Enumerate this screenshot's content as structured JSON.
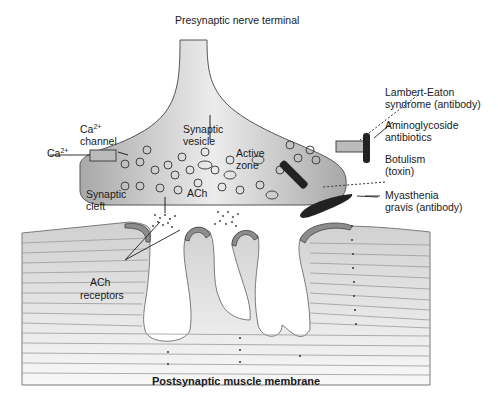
{
  "title": "Presynaptic nerve terminal",
  "footer": "Postsynaptic muscle membrane",
  "labels": {
    "ca_channel_a": "Ca",
    "ca_channel_sup": "2+",
    "ca_channel_b": "channel",
    "ca_ion": "Ca",
    "ca_ion_sup": "2+",
    "synaptic_vesicle_a": "Synaptic",
    "synaptic_vesicle_b": "vesicle",
    "active_zone_a": "Active",
    "active_zone_b": "zone",
    "synaptic_cleft_a": "Synaptic",
    "synaptic_cleft_b": "cleft",
    "ach": "ACh",
    "ach_receptors_a": "ACh",
    "ach_receptors_b": "receptors",
    "lambert_eaton_a": "Lambert-Eaton",
    "lambert_eaton_b": "syndrome (antibody)",
    "aminoglycoside_a": "Aminoglycoside",
    "aminoglycoside_b": "antibiotics",
    "botulism_a": "Botulism",
    "botulism_b": "(toxin)",
    "myasthenia_a": "Myasthenia",
    "myasthenia_b": "gravis (antibody)"
  },
  "colors": {
    "terminal_fill": "#c8c8c8",
    "receptor_fill": "#8c8c8c",
    "blocker_fill": "#222222",
    "membrane_line": "#9a9a9a"
  }
}
